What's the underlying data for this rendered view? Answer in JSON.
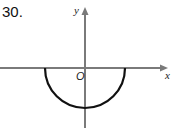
{
  "problem_number": "30.",
  "axes": {
    "x_label": "x",
    "y_label": "y",
    "origin_label": "O",
    "axis_color": "#7a7a7a"
  },
  "curve": {
    "type": "lower semicircle",
    "description": "lower half of a circle centered at the origin",
    "color": "#111111"
  }
}
